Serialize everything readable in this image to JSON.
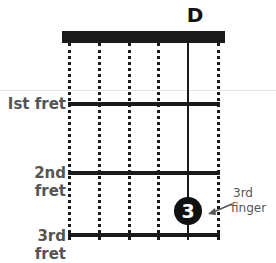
{
  "chord": {
    "name": "D"
  },
  "fret_labels": [
    {
      "label": "Ist fret"
    },
    {
      "label": "2nd fret"
    },
    {
      "label": "3rd fret"
    }
  ],
  "strings": {
    "count": 6,
    "fretted_string_index": 4
  },
  "finger_marker": {
    "number": "3",
    "string_index": 4,
    "fret": 3,
    "annotation_line1": "3rd",
    "annotation_line2": "finger"
  },
  "colors": {
    "ink": "#1a1a1a",
    "label": "#555555",
    "background": "#ffffff"
  }
}
